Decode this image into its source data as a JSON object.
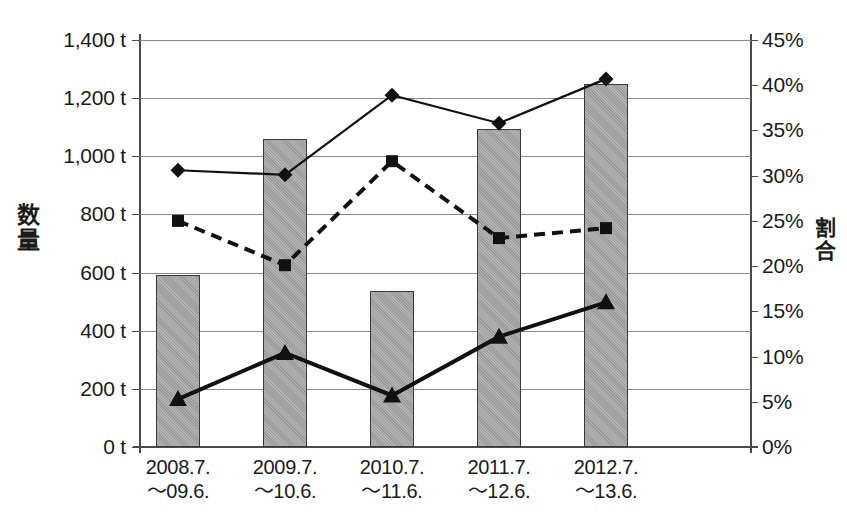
{
  "chart_data": {
    "type": "bar",
    "title": "",
    "categories": [
      "2008.7.\n～09.6.",
      "2009.7.\n～10.6.",
      "2010.7.\n～11.6.",
      "2011.7.\n～12.6.",
      "2012.7.\n～13.6."
    ],
    "category_lines": [
      [
        "2008.7.",
        "～09.6."
      ],
      [
        "2009.7.",
        "～10.6."
      ],
      [
        "2010.7.",
        "～11.6."
      ],
      [
        "2011.7.",
        "～12.6."
      ],
      [
        "2012.7.",
        "～13.6."
      ]
    ],
    "xlabel": "",
    "ylabel": "数量",
    "y2label": "割合",
    "ylim": [
      0,
      1400
    ],
    "y2lim": [
      0,
      45
    ],
    "yticks": [
      0,
      200,
      400,
      600,
      800,
      1000,
      1200,
      1400
    ],
    "ytick_labels": [
      "0 t",
      "200 t",
      "400 t",
      "600 t",
      "800 t",
      "1,000 t",
      "1,200 t",
      "1,400 t"
    ],
    "y2ticks": [
      0,
      5,
      10,
      15,
      20,
      25,
      30,
      35,
      40,
      45
    ],
    "y2tick_labels": [
      "0%",
      "5%",
      "10%",
      "15%",
      "20%",
      "25%",
      "30%",
      "35%",
      "40%",
      "45%"
    ],
    "grid": true,
    "legend": "none",
    "series": [
      {
        "name": "数量",
        "type": "bar",
        "axis": "left",
        "unit": "t",
        "values": [
          590,
          1060,
          535,
          1095,
          1250
        ],
        "color": "#a8a8a8",
        "edge_color": "#3a3a3a"
      },
      {
        "name": "割合-diamond",
        "type": "line",
        "axis": "right",
        "unit": "%",
        "marker": "diamond",
        "line_style": "solid",
        "values": [
          30.6,
          30.1,
          38.9,
          35.8,
          40.7
        ],
        "color": "#111111"
      },
      {
        "name": "割合-square",
        "type": "line",
        "axis": "right",
        "unit": "%",
        "marker": "square",
        "line_style": "dashed",
        "values": [
          25.0,
          20.1,
          31.6,
          23.1,
          24.2
        ],
        "color": "#111111"
      },
      {
        "name": "割合-triangle",
        "type": "line",
        "axis": "right",
        "unit": "%",
        "marker": "triangle",
        "line_style": "solid-thick",
        "values": [
          5.3,
          10.4,
          5.7,
          12.2,
          16.0
        ],
        "color": "#111111"
      }
    ]
  },
  "geometry": {
    "plot_left": 140,
    "plot_right": 751,
    "plot_top": 40,
    "plot_bottom": 447,
    "bar_centers": [
      178,
      285,
      392,
      499,
      606
    ],
    "bar_width": 44
  }
}
